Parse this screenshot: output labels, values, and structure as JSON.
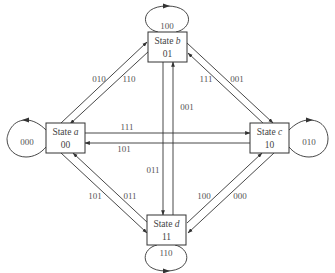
{
  "diagram": {
    "type": "state-transition",
    "states": [
      {
        "id": "a",
        "prefix": "State ",
        "name": "a",
        "code": "00",
        "self_loop": "000"
      },
      {
        "id": "b",
        "prefix": "State ",
        "name": "b",
        "code": "01",
        "self_loop": "100"
      },
      {
        "id": "c",
        "prefix": "State ",
        "name": "c",
        "code": "10",
        "self_loop": "010"
      },
      {
        "id": "d",
        "prefix": "State ",
        "name": "d",
        "code": "11",
        "self_loop": "110"
      }
    ],
    "transitions": [
      {
        "from": "a",
        "to": "b",
        "label": "010"
      },
      {
        "from": "b",
        "to": "a",
        "label": "110"
      },
      {
        "from": "b",
        "to": "c",
        "label": "001"
      },
      {
        "from": "c",
        "to": "b",
        "label": "111"
      },
      {
        "from": "a",
        "to": "c",
        "label": "111"
      },
      {
        "from": "c",
        "to": "a",
        "label": "101"
      },
      {
        "from": "b",
        "to": "d",
        "label": "011"
      },
      {
        "from": "d",
        "to": "b",
        "label": "001"
      },
      {
        "from": "a",
        "to": "d",
        "label": "101"
      },
      {
        "from": "d",
        "to": "a",
        "label": "011"
      },
      {
        "from": "d",
        "to": "c",
        "label": "100"
      },
      {
        "from": "c",
        "to": "d",
        "label": "000"
      }
    ],
    "colors": {
      "stroke": "#333333",
      "text": "#444444",
      "background": "#ffffff"
    }
  }
}
